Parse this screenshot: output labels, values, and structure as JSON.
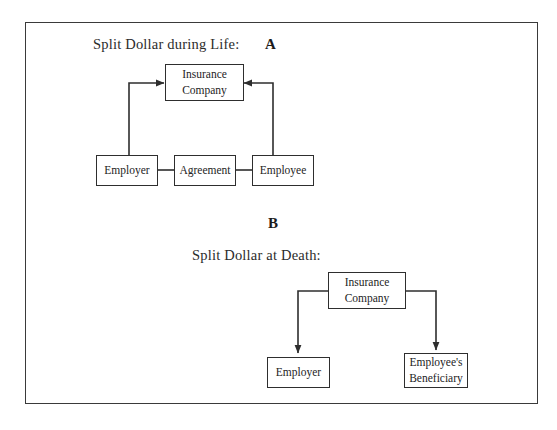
{
  "figure": {
    "border_color": "#3a3a3a",
    "line_color": "#2e2e2e",
    "text_color": "#242424"
  },
  "panel_a": {
    "letter": "A",
    "caption": "Split Dollar during Life:",
    "nodes": {
      "insurance_line1": "Insurance",
      "insurance_line2": "Company",
      "employer": "Employer",
      "agreement": "Agreement",
      "employee": "Employee"
    }
  },
  "panel_b": {
    "letter": "B",
    "caption": "Split Dollar at Death:",
    "nodes": {
      "insurance_line1": "Insurance",
      "insurance_line2": "Company",
      "employer": "Employer",
      "beneficiary_line1": "Employee's",
      "beneficiary_line2": "Beneficiary"
    }
  }
}
